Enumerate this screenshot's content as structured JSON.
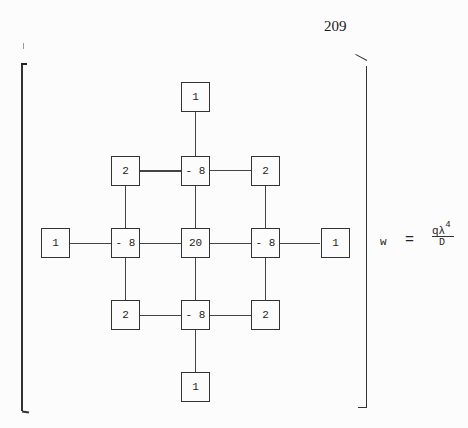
{
  "page": {
    "number": "209",
    "margin_mark": "I"
  },
  "stencil": {
    "description": "Finite-difference stencil (13-point) for biharmonic operator",
    "nodes": [
      {
        "id": "top",
        "value": "1",
        "row": 0,
        "col": 2
      },
      {
        "id": "upper-left",
        "value": "2",
        "row": 1,
        "col": 1
      },
      {
        "id": "upper-mid",
        "value": "- 8",
        "row": 1,
        "col": 2
      },
      {
        "id": "upper-right",
        "value": "2",
        "row": 1,
        "col": 3
      },
      {
        "id": "far-left",
        "value": "1",
        "row": 2,
        "col": 0
      },
      {
        "id": "mid-left",
        "value": "- 8",
        "row": 2,
        "col": 1
      },
      {
        "id": "center",
        "value": "20",
        "row": 2,
        "col": 2
      },
      {
        "id": "mid-right",
        "value": "- 8",
        "row": 2,
        "col": 3
      },
      {
        "id": "far-right",
        "value": "1",
        "row": 2,
        "col": 4
      },
      {
        "id": "lower-left",
        "value": "2",
        "row": 3,
        "col": 1
      },
      {
        "id": "lower-mid",
        "value": "- 8",
        "row": 3,
        "col": 2
      },
      {
        "id": "lower-right",
        "value": "2",
        "row": 3,
        "col": 3
      },
      {
        "id": "bottom",
        "value": "1",
        "row": 4,
        "col": 2
      }
    ]
  },
  "equation": {
    "lhs": "w",
    "operator": "=",
    "numerator": "qλ",
    "exponent": "4",
    "denominator": "D"
  }
}
